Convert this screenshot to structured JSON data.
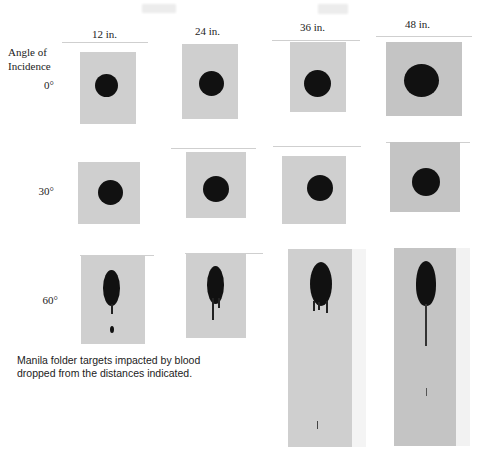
{
  "figure": {
    "row_header": [
      "Angle of",
      "Incidence"
    ],
    "columns": [
      "12 in.",
      "24 in.",
      "36 in.",
      "48 in."
    ],
    "rows": [
      "0°",
      "30°",
      "60°"
    ],
    "caption": [
      "Manila folder targets impacted by blood",
      "dropped from the distances indicated."
    ]
  },
  "colors": {
    "background": "#ffffff",
    "target": "#cfcfcf",
    "blood": "#111111",
    "text": "#222222"
  }
}
